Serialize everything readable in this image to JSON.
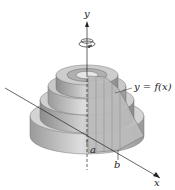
{
  "figure": {
    "type": "solid-of-revolution-cylindrical-shells",
    "labels": {
      "y_axis": "y",
      "x_axis": "x",
      "curve": "y = f(x)",
      "a": "a",
      "b": "b"
    },
    "icons": {
      "rotation": "rotation-arrow-icon"
    },
    "colors": {
      "shell_light": "#d9d9d9",
      "shell_mid": "#b8b8b8",
      "shell_dark": "#8f8f8f",
      "axis": "#222222"
    }
  }
}
